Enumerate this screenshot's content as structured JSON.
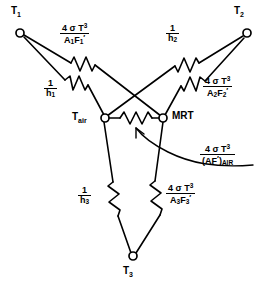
{
  "diagram": {
    "stroke_color": "#000000",
    "background_color": "#ffffff",
    "nodes": [
      {
        "id": "T1",
        "label": "T",
        "sub": "1",
        "x": 20,
        "y": 33,
        "label_x": 11,
        "label_y": 8
      },
      {
        "id": "T2",
        "label": "T",
        "sub": "2",
        "x": 247,
        "y": 33,
        "label_x": 236,
        "label_y": 8
      },
      {
        "id": "T3",
        "label": "T",
        "sub": "3",
        "x": 133,
        "y": 257,
        "label_x": 124,
        "label_y": 268
      },
      {
        "id": "Tair",
        "label": "T",
        "sub": "air",
        "x": 105,
        "y": 118,
        "label_x": 73,
        "label_y": 113
      },
      {
        "id": "MRT",
        "label": "MRT",
        "sub": "",
        "x": 163,
        "y": 118,
        "label_x": 172,
        "label_y": 112
      }
    ],
    "resistors": [
      {
        "id": "R-A1F1",
        "from": "T1",
        "to": "MRT",
        "kind": "radiation"
      },
      {
        "id": "R-h1",
        "from": "T1",
        "to": "Tair",
        "kind": "convection"
      },
      {
        "id": "R-h2",
        "from": "T2",
        "to": "Tair",
        "kind": "convection"
      },
      {
        "id": "R-A2F2",
        "from": "T2",
        "to": "MRT",
        "kind": "radiation"
      },
      {
        "id": "R-h3",
        "from": "T3",
        "to": "Tair",
        "kind": "convection"
      },
      {
        "id": "R-A3F3",
        "from": "T3",
        "to": "MRT",
        "kind": "radiation"
      },
      {
        "id": "R-AIR",
        "from": "Tair",
        "to": "MRT",
        "kind": "air"
      }
    ],
    "labels": {
      "r_a1f1": {
        "numerator": "4 σ T³",
        "denominator": "A₁F₁′",
        "num_plain": "4 σ T",
        "num_exp": "3",
        "den_letter1": "A",
        "den_sub1": "1",
        "den_letter2": "F",
        "den_sub2": "1"
      },
      "r_h1": {
        "numerator": "1",
        "denominator": "h₁",
        "den_letter": "h",
        "den_sub": "1"
      },
      "r_h2": {
        "numerator": "1",
        "denominator": "h₂",
        "den_letter": "h",
        "den_sub": "2"
      },
      "r_a2f2": {
        "numerator": "4 σ T³",
        "denominator": "A₂F₂′",
        "num_plain": "4 σ T",
        "num_exp": "3",
        "den_letter1": "A",
        "den_sub1": "2",
        "den_letter2": "F",
        "den_sub2": "2"
      },
      "r_h3": {
        "numerator": "1",
        "denominator": "h₃",
        "den_letter": "h",
        "den_sub": "3"
      },
      "r_a3f3": {
        "numerator": "4 σ T³",
        "denominator": "A₃F₃′",
        "num_plain": "4 σ T",
        "num_exp": "3",
        "den_letter1": "A",
        "den_sub1": "3",
        "den_letter2": "F",
        "den_sub2": "3"
      },
      "r_air": {
        "numerator": "4 σ T³",
        "denominator": "(AF′)AIR",
        "num_plain": "4 σ T",
        "num_exp": "3",
        "den_paren_open": "(AF",
        "den_prime": "′",
        "den_paren_close": ")",
        "den_sub": "AIR"
      }
    },
    "symbols": {
      "sigma": "σ",
      "one": "1",
      "four": "4",
      "T": "T",
      "exp3": "3",
      "prime": "′"
    }
  }
}
